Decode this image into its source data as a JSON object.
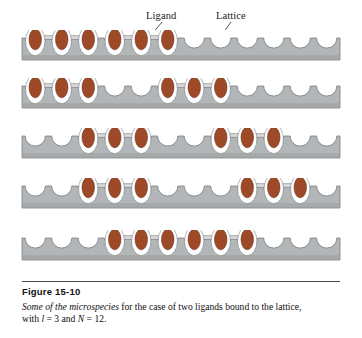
{
  "figure": {
    "labels": {
      "ligand": "Ligand",
      "lattice": "Lattice"
    },
    "caption": {
      "title": "Figure 15-10",
      "lead_italic": "Some of the microspecies",
      "body_part1": " for the case of two ligands bound to the lattice, with ",
      "var_l": "l",
      "eq1": " = 3 and ",
      "var_N": "N",
      "eq2": " = 12."
    },
    "colors": {
      "ligand_fill": "#9e4a28",
      "ligand_stroke": "#6d2f18",
      "ligand_surround": "#ffffff",
      "lattice_fill": "#b3b6b8",
      "lattice_shadow": "#9a9d9f",
      "lattice_stroke": "#6f7274",
      "connector": "#d9dadb",
      "background": "#ffffff",
      "text": "#111111"
    },
    "geometry": {
      "lattice_sites": 12,
      "ligand_length": 3,
      "ligands_per_row": 2,
      "rows": 5
    },
    "rows": [
      {
        "name": "microspecies-row-1",
        "occupied": [
          1,
          2,
          3,
          4,
          5,
          6
        ],
        "ligand_starts": [
          1,
          4
        ]
      },
      {
        "name": "microspecies-row-2",
        "occupied": [
          1,
          2,
          3,
          6,
          7,
          8
        ],
        "ligand_starts": [
          1,
          6
        ]
      },
      {
        "name": "microspecies-row-3",
        "occupied": [
          3,
          4,
          5,
          8,
          9,
          10
        ],
        "ligand_starts": [
          3,
          8
        ]
      },
      {
        "name": "microspecies-row-4",
        "occupied": [
          3,
          4,
          5,
          9,
          10,
          11
        ],
        "ligand_starts": [
          3,
          9
        ]
      },
      {
        "name": "microspecies-row-5",
        "occupied": [
          4,
          5,
          6,
          7,
          8,
          9
        ],
        "ligand_starts": [
          4,
          7
        ]
      }
    ]
  }
}
